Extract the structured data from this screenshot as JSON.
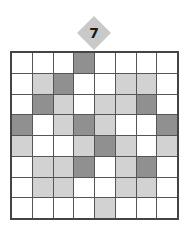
{
  "level": {
    "number": "7"
  },
  "colors": {
    "white": "#ffffff",
    "light": "#d2d2d2",
    "dark": "#909090",
    "badge": "#c9c9c9",
    "grid_line": "#555555"
  },
  "grid": {
    "rows": 8,
    "cols": 8,
    "legend": {
      "W": "white",
      "L": "light-gray",
      "D": "dark-gray"
    },
    "cells": [
      [
        "W",
        "W",
        "W",
        "D",
        "W",
        "W",
        "W",
        "W"
      ],
      [
        "W",
        "L",
        "D",
        "W",
        "W",
        "L",
        "L",
        "W"
      ],
      [
        "W",
        "D",
        "L",
        "W",
        "L",
        "L",
        "D",
        "W"
      ],
      [
        "D",
        "W",
        "L",
        "D",
        "L",
        "W",
        "W",
        "D"
      ],
      [
        "L",
        "W",
        "W",
        "L",
        "D",
        "L",
        "W",
        "L"
      ],
      [
        "W",
        "L",
        "L",
        "D",
        "W",
        "L",
        "D",
        "W"
      ],
      [
        "W",
        "L",
        "L",
        "W",
        "W",
        "L",
        "L",
        "W"
      ],
      [
        "W",
        "W",
        "W",
        "W",
        "L",
        "W",
        "W",
        "W"
      ]
    ]
  }
}
